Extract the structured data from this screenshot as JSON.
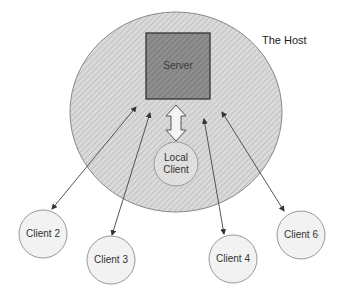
{
  "diagram": {
    "host": {
      "label": "The Host"
    },
    "server": {
      "label": "Server"
    },
    "local_client": {
      "line1": "Local",
      "line2": "Client"
    },
    "clients": [
      {
        "label": "Client 2"
      },
      {
        "label": "Client 3"
      },
      {
        "label": "Client 4"
      },
      {
        "label": "Client 6"
      }
    ],
    "colors": {
      "host_fill": "#d4d4d4",
      "server_fill": "#8c8c8c",
      "client_fill": "#f2f2f2",
      "stroke": "#555555"
    }
  }
}
